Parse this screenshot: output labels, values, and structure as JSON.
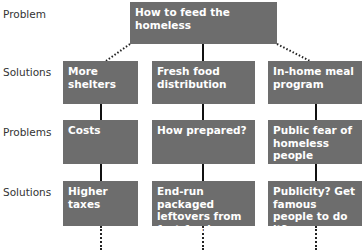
{
  "row_labels": [
    "Problem",
    "Solutions",
    "Problems",
    "Solutions"
  ],
  "root": {
    "label": "How to feed the homeless"
  },
  "columns": [
    {
      "solution": "More shelters",
      "problem": "Costs",
      "sub_solution": "Higher taxes"
    },
    {
      "solution": "Fresh food distribution",
      "problem": "How prepared?",
      "sub_solution": "End-run packaged leftovers from fast-food chains."
    },
    {
      "solution": "In-home meal program",
      "problem": "Public fear of homeless people",
      "sub_solution": "Publicity? Get famous people to do it?"
    }
  ],
  "colors": {
    "box": "#6d6d6d",
    "text": "#ffffff",
    "line": "#111111"
  }
}
